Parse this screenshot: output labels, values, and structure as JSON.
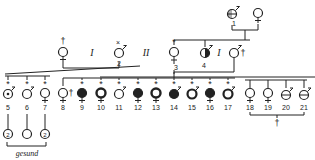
{
  "diagram": {
    "type": "pedigree",
    "generations": {
      "gen1": [
        {
          "id": "1",
          "sex": "male",
          "status": "half-affected",
          "x": 232,
          "y": 14
        },
        {
          "id": "",
          "sex": "female",
          "status": "normal",
          "x": 258,
          "y": 14
        }
      ],
      "gen2": [
        {
          "id": "",
          "sex": "female",
          "status": "deceased",
          "mark": "cross",
          "x": 63,
          "y": 52,
          "marriage": "I"
        },
        {
          "id": "2",
          "sex": "male",
          "status": "x-mark",
          "x": 120,
          "y": 52,
          "marriage": "II"
        },
        {
          "id": "3",
          "sex": "female",
          "status": "asterisk",
          "x": 174,
          "y": 52
        },
        {
          "id": "4",
          "sex": "male",
          "status": "half-affected",
          "x": 205,
          "y": 52
        },
        {
          "id": "",
          "sex": "male",
          "status": "deceased",
          "mark": "cross",
          "x": 236,
          "y": 52,
          "marriage": "I"
        }
      ],
      "gen3": [
        {
          "id": "5",
          "sex": "male",
          "status": "dot",
          "x": 8
        },
        {
          "id": "6",
          "sex": "male",
          "status": "normal",
          "x": 27
        },
        {
          "id": "7",
          "sex": "female",
          "status": "normal",
          "x": 45
        },
        {
          "id": "8",
          "sex": "female",
          "status": "deceased",
          "x": 63
        },
        {
          "id": "9",
          "sex": "female",
          "status": "affected",
          "x": 82
        },
        {
          "id": "10",
          "sex": "female",
          "status": "ring",
          "x": 101
        },
        {
          "id": "11",
          "sex": "male",
          "status": "normal",
          "x": 119
        },
        {
          "id": "12",
          "sex": "female",
          "status": "affected",
          "x": 138
        },
        {
          "id": "13",
          "sex": "female",
          "status": "ring",
          "x": 156
        },
        {
          "id": "14",
          "sex": "male",
          "status": "affected",
          "x": 174
        },
        {
          "id": "15",
          "sex": "male",
          "status": "ring",
          "x": 192
        },
        {
          "id": "16",
          "sex": "female",
          "status": "affected",
          "x": 210
        },
        {
          "id": "17",
          "sex": "male",
          "status": "ring",
          "x": 228
        },
        {
          "id": "18",
          "sex": "female",
          "status": "normal",
          "x": 250
        },
        {
          "id": "19",
          "sex": "female",
          "status": "normal",
          "x": 268
        },
        {
          "id": "20",
          "sex": "male",
          "status": "half-bar",
          "x": 286
        },
        {
          "id": "21",
          "sex": "male",
          "status": "half-bar",
          "x": 304
        }
      ],
      "gen4": [
        {
          "id": "",
          "mark": "2",
          "x": 8
        },
        {
          "id": "",
          "mark": "",
          "x": 27
        },
        {
          "id": "",
          "mark": "2",
          "x": 45
        }
      ]
    },
    "labels": {
      "marriage_I_left": "I",
      "marriage_II": "II",
      "marriage_I_right": "I",
      "gesund": "gesund",
      "deceased_mark": "†"
    },
    "numbers": [
      "1",
      "2",
      "3",
      "4",
      "5",
      "6",
      "7",
      "8",
      "9",
      "10",
      "11",
      "12",
      "13",
      "14",
      "15",
      "16",
      "17",
      "18",
      "19",
      "20",
      "21"
    ]
  }
}
